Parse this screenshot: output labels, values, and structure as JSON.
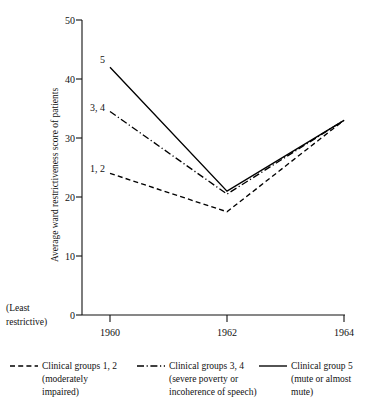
{
  "chart_data": {
    "type": "line",
    "title": "",
    "xlabel": "",
    "ylabel": "Average ward restrictiveness score of patients",
    "x": [
      1960,
      1962,
      1964
    ],
    "xtick_labels": [
      "1960",
      "1962",
      "1964"
    ],
    "ytick_labels": [
      "0",
      "10",
      "20",
      "30",
      "40",
      "50"
    ],
    "ytick_values": [
      0,
      10,
      20,
      30,
      40,
      50
    ],
    "ylim": [
      0,
      50
    ],
    "xlim": [
      1960,
      1964
    ],
    "grid": false,
    "legend_position": "below-axes",
    "axis_note_line1": "(Least",
    "axis_note_line2": "restrictive)",
    "series": [
      {
        "name": "Clinical groups 1, 2",
        "tag": "1, 2",
        "linestyle": "dashed",
        "values": [
          24,
          17.5,
          33
        ],
        "description_line1": "(moderately",
        "description_line2": "impaired)"
      },
      {
        "name": "Clinical groups 3, 4",
        "tag": "3, 4",
        "linestyle": "dashdot",
        "values": [
          34.5,
          20.5,
          33
        ],
        "description_line1": "(severe poverty or",
        "description_line2": "incoherence of speech)"
      },
      {
        "name": "Clinical group 5",
        "tag": "5",
        "linestyle": "solid",
        "values": [
          42,
          21,
          33
        ],
        "description_line1": "(mute or almost",
        "description_line2": "mute)"
      }
    ]
  },
  "colors": {
    "ink": "#111111",
    "background": "#ffffff"
  }
}
